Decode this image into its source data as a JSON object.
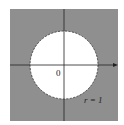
{
  "diagram": {
    "region_fill": "#8f8f8f",
    "disk_fill": "#ffffff",
    "axis_color": "#222222",
    "origin_label": "0",
    "radius_label": "r = 1",
    "circle": {
      "cx": 64,
      "cy": 65,
      "r": 34,
      "boundary": "dashed"
    }
  }
}
